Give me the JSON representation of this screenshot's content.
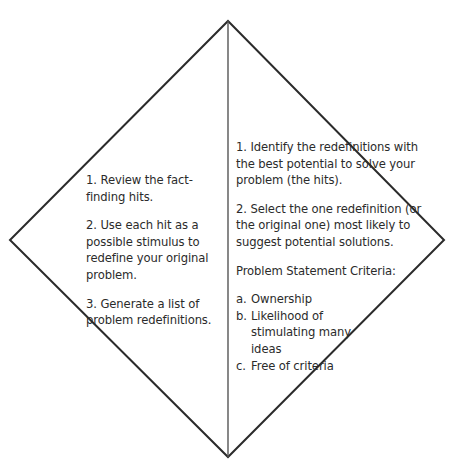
{
  "diagram": {
    "shape": "diamond",
    "vertices": {
      "top": [
        228,
        21
      ],
      "right": [
        444,
        240
      ],
      "bottom": [
        228,
        457
      ],
      "left": [
        10,
        240
      ]
    },
    "divider_x": 228,
    "stroke_color": "#2b2b2b"
  },
  "left_panel": {
    "steps": [
      "1.  Review the fact-finding hits.",
      "2.  Use each hit as a possible stimulus to redefine your original problem.",
      "3.  Generate a list of problem redefinitions."
    ]
  },
  "right_panel": {
    "steps": [
      "1.  Identify the redefinitions with the best potential to solve your problem (the hits).",
      "2.  Select the one redefinition (or the original one) most likely to suggest potential solutions."
    ],
    "criteria_heading": "Problem Statement Criteria:",
    "criteria": [
      {
        "marker": "a.",
        "text": "Ownership"
      },
      {
        "marker": "b.",
        "text": "Likelihood of stimulating many ideas"
      },
      {
        "marker": "c.",
        "text": "Free of criteria"
      }
    ]
  }
}
